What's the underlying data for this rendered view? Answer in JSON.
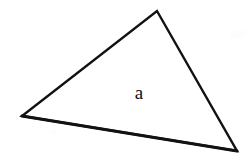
{
  "figure": {
    "canvas": {
      "width": 251,
      "height": 165,
      "background_color": "#ffffff"
    },
    "shape": {
      "name": "triangle",
      "type": "polygon",
      "stroke_color": "#121212",
      "fill_color": "#ffffff",
      "stroke_width": 2.4,
      "vertices": [
        {
          "name": "apex",
          "x": 157,
          "y": 11
        },
        {
          "name": "bottom-right",
          "x": 237,
          "y": 151
        },
        {
          "name": "left",
          "x": 22,
          "y": 116
        }
      ],
      "points_attr": "157,11 237,151 22,116"
    },
    "edges": [
      {
        "name": "upper-left-edge",
        "from": "left",
        "to": "apex",
        "d": "M 22 116 L 157 11"
      },
      {
        "name": "right-edge",
        "from": "apex",
        "to": "bottom-right",
        "d": "M 157 11 L 237 151"
      },
      {
        "name": "bottom-edge",
        "from": "bottom-right",
        "to": "left",
        "d": "M 237 151 L 22 116"
      }
    ],
    "label": {
      "text": "a",
      "x": 139,
      "y": 99,
      "font_size": 19,
      "color": "#0d0d0d"
    }
  }
}
